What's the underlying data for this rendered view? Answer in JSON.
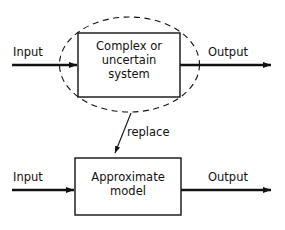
{
  "diagram": {
    "background_color": "#ffffff",
    "stroke_color": "#111111",
    "upper": {
      "boundary_shape": "dashed-ellipse",
      "block_label": "Complex or\nuncertain\nsystem",
      "input_label": "Input",
      "output_label": "Output"
    },
    "lower": {
      "block_label": "Approximate\nmodel",
      "input_label": "Input",
      "output_label": "Output"
    },
    "connector": {
      "label": "replace",
      "style": "solid-line-with-arrowhead",
      "direction": "downward"
    }
  }
}
